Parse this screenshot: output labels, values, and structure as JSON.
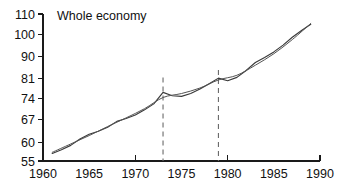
{
  "chart_data": {
    "type": "line",
    "title": "Whole economy",
    "xlabel": "",
    "ylabel": "",
    "scale": "log-y",
    "grid": false,
    "legend": "none",
    "xlim": [
      1960,
      1990
    ],
    "ylim": [
      55,
      110
    ],
    "x_ticks": [
      1960,
      1965,
      1970,
      1975,
      1980,
      1985,
      1990
    ],
    "x_tick_labels": [
      "1960",
      "1965",
      "1970",
      "1975",
      "1980",
      "1985",
      "1990"
    ],
    "x_major_ticks": [
      1960,
      1970,
      1980,
      1990
    ],
    "y_ticks": [
      55,
      60,
      67,
      74,
      81,
      90,
      100,
      110
    ],
    "y_tick_labels": [
      "55",
      "60",
      "67",
      "74",
      "81",
      "90",
      "100",
      "110"
    ],
    "annotations": {
      "vertical_marker_years": [
        1973,
        1979
      ],
      "vertical_marker_style": "dashed",
      "vertical_marker_top_values": [
        81.5,
        84.5
      ]
    },
    "series": [
      {
        "name": "actual",
        "style": "solid-wiggly",
        "color": "#3a3a3a",
        "x": [
          1961,
          1962,
          1963,
          1964,
          1965,
          1966,
          1967,
          1968,
          1969,
          1970,
          1971,
          1972,
          1973,
          1974,
          1975,
          1976,
          1977,
          1978,
          1979,
          1980,
          1981,
          1982,
          1983,
          1984,
          1985,
          1986,
          1987,
          1988,
          1989
        ],
        "values": [
          57.0,
          58.0,
          59.2,
          61.0,
          62.4,
          63.3,
          64.5,
          66.3,
          67.2,
          68.3,
          70.0,
          72.0,
          76.0,
          74.8,
          74.6,
          75.6,
          77.2,
          79.2,
          81.3,
          80.3,
          81.6,
          84.3,
          87.5,
          89.6,
          92.0,
          95.0,
          98.6,
          101.8,
          104.8
        ]
      },
      {
        "name": "trend",
        "style": "solid-smooth",
        "color": "#545454",
        "x": [
          1961,
          1963,
          1965,
          1967,
          1969,
          1971,
          1973,
          1975,
          1977,
          1979,
          1981,
          1983,
          1985,
          1987,
          1989
        ],
        "values": [
          57.3,
          59.6,
          62.0,
          64.7,
          67.4,
          70.4,
          74.2,
          75.6,
          77.6,
          80.6,
          82.4,
          86.4,
          91.2,
          97.5,
          105.2
        ]
      }
    ]
  }
}
